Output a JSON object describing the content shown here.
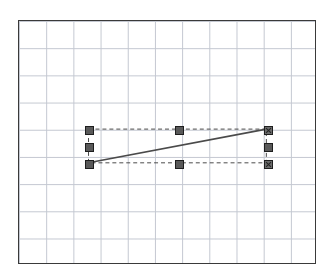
{
  "app": {
    "name": "vector-drawing-canvas",
    "background_color": "#ffffff"
  },
  "canvas": {
    "name": "drawing-canvas",
    "x": 18,
    "y": 20,
    "width": 298,
    "height": 244,
    "background_color": "#ffffff",
    "border_color": "#3a3a3a",
    "border_width": 1,
    "grid": {
      "visible": true,
      "style": "dotted",
      "spacing": 27.2,
      "color": "#b9bec9",
      "origin_x": 0,
      "origin_y": 0
    }
  },
  "chart_data": {
    "type": "line",
    "title": "",
    "subtitle": "",
    "xlabel": "",
    "ylabel": "",
    "grid": true,
    "legend": "none",
    "xlim": [
      0,
      298
    ],
    "ylim": [
      0,
      244
    ],
    "series": [
      {
        "name": "selected-line",
        "stroke": "#4a4a4a",
        "stroke_width": 1.6,
        "x": [
          70,
          249
        ],
        "y": [
          143,
          109
        ]
      }
    ],
    "annotations": [
      {
        "name": "selection-bounding-box",
        "type": "rect",
        "style": "dashed",
        "x": 70,
        "y": 109,
        "width": 179,
        "height": 34,
        "stroke": "#4a4a4a",
        "stroke_width": 1
      }
    ]
  },
  "selection": {
    "name": "selection-handles",
    "object_type": "line",
    "handle_size": 9,
    "handle_fill": "#595959",
    "handle_border": "#1e1e1e",
    "anchor_fill": "#6b6b6b",
    "handles": [
      {
        "name": "handle-top-left",
        "x": 70,
        "y": 109,
        "kind": "corner",
        "anchor": false
      },
      {
        "name": "handle-top-center",
        "x": 160,
        "y": 109,
        "kind": "edge",
        "anchor": false
      },
      {
        "name": "handle-top-right",
        "x": 249,
        "y": 109,
        "kind": "corner",
        "anchor": true
      },
      {
        "name": "handle-middle-left",
        "x": 70,
        "y": 126,
        "kind": "edge",
        "anchor": false
      },
      {
        "name": "handle-middle-right",
        "x": 249,
        "y": 126,
        "kind": "edge",
        "anchor": false
      },
      {
        "name": "handle-bottom-left",
        "x": 70,
        "y": 143,
        "kind": "corner",
        "anchor": false
      },
      {
        "name": "handle-bottom-center",
        "x": 160,
        "y": 143,
        "kind": "edge",
        "anchor": false
      },
      {
        "name": "handle-bottom-right",
        "x": 249,
        "y": 143,
        "kind": "corner",
        "anchor": true
      }
    ]
  }
}
